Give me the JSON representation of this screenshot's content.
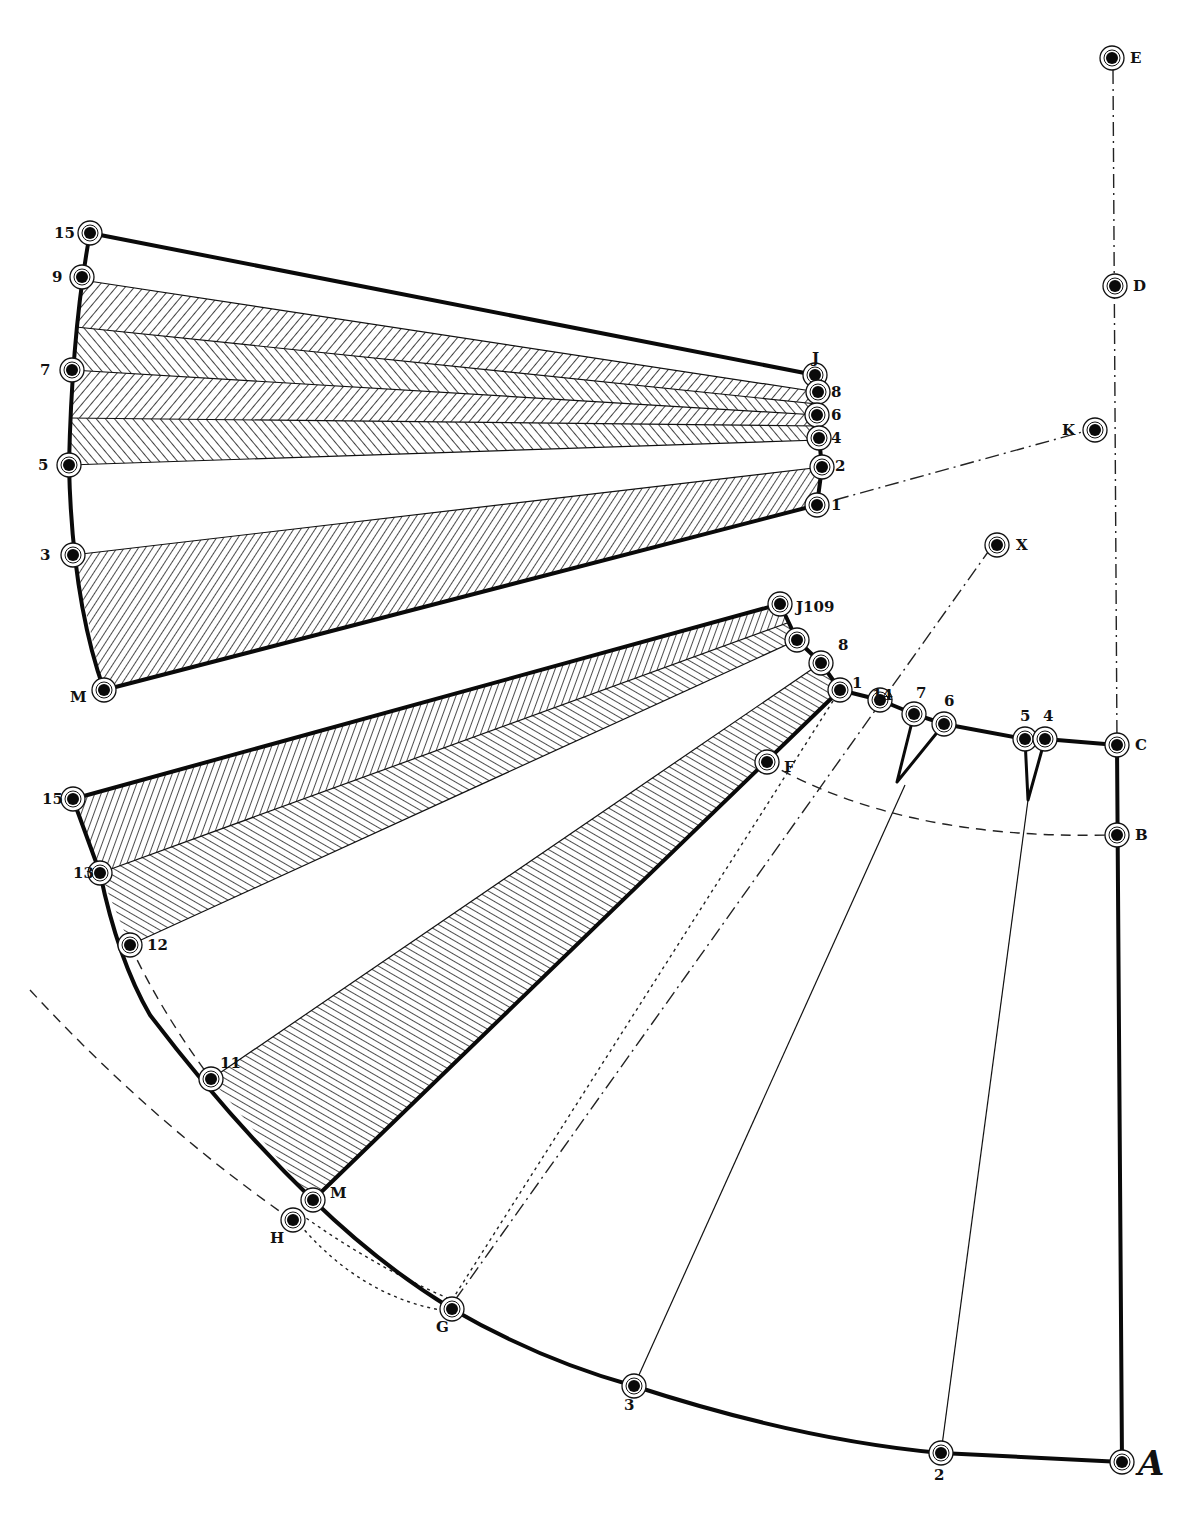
{
  "diagram": {
    "colors": {
      "ink": "#0a0a0a",
      "paper": "#ffffff"
    },
    "points": [
      {
        "id": "E",
        "label": "E",
        "x": 1112,
        "y": 58,
        "lx": 1130,
        "ly": 63
      },
      {
        "id": "D",
        "label": "D",
        "x": 1115,
        "y": 286,
        "lx": 1133,
        "ly": 291
      },
      {
        "id": "K",
        "label": "K",
        "x": 1095,
        "y": 430,
        "lx": 1062,
        "ly": 435
      },
      {
        "id": "X",
        "label": "X",
        "x": 997,
        "y": 545,
        "lx": 1016,
        "ly": 550
      },
      {
        "id": "C",
        "label": "C",
        "x": 1117,
        "y": 745,
        "lx": 1135,
        "ly": 750
      },
      {
        "id": "B",
        "label": "B",
        "x": 1117,
        "y": 835,
        "lx": 1135,
        "ly": 840
      },
      {
        "id": "A",
        "label": "A",
        "x": 1122,
        "y": 1462,
        "lx": 1138,
        "ly": 1475
      },
      {
        "id": "P2",
        "label": "2",
        "x": 941,
        "y": 1453,
        "lx": 934,
        "ly": 1480
      },
      {
        "id": "P3",
        "label": "3",
        "x": 634,
        "y": 1386,
        "lx": 624,
        "ly": 1410
      },
      {
        "id": "G",
        "label": "G",
        "x": 452,
        "y": 1309,
        "lx": 436,
        "ly": 1332
      },
      {
        "id": "H",
        "label": "H",
        "x": 293,
        "y": 1220,
        "lx": 270,
        "ly": 1243
      },
      {
        "id": "M2",
        "label": "M",
        "x": 313,
        "y": 1200,
        "lx": 330,
        "ly": 1198
      },
      {
        "id": "P11",
        "label": "11",
        "x": 211,
        "y": 1079,
        "lx": 220,
        "ly": 1068
      },
      {
        "id": "P12",
        "label": "12",
        "x": 130,
        "y": 945,
        "lx": 147,
        "ly": 950
      },
      {
        "id": "P13",
        "label": "13",
        "x": 100,
        "y": 873,
        "lx": 73,
        "ly": 878
      },
      {
        "id": "P15",
        "label": "15",
        "x": 73,
        "y": 799,
        "lx": 42,
        "ly": 804
      },
      {
        "id": "F",
        "label": "F",
        "x": 767,
        "y": 762,
        "lx": 784,
        "ly": 772
      },
      {
        "id": "P1b",
        "label": "1",
        "x": 840,
        "y": 690,
        "lx": 852,
        "ly": 688
      },
      {
        "id": "P8b",
        "label": "8",
        "x": 821,
        "y": 663,
        "lx": 838,
        "ly": 650
      },
      {
        "id": "P9b",
        "label": "9",
        "x": 797,
        "y": 640,
        "lx": 0,
        "ly": 0
      },
      {
        "id": "J2",
        "label": "J109",
        "x": 780,
        "y": 604,
        "lx": 796,
        "ly": 612
      },
      {
        "id": "P14",
        "label": "14",
        "x": 880,
        "y": 700,
        "lx": 872,
        "ly": 700
      },
      {
        "id": "P7b",
        "label": "7",
        "x": 914,
        "y": 714,
        "lx": 916,
        "ly": 698
      },
      {
        "id": "P6b",
        "label": "6",
        "x": 944,
        "y": 724,
        "lx": 944,
        "ly": 706
      },
      {
        "id": "P5b",
        "label": "5",
        "x": 1025,
        "y": 739,
        "lx": 1020,
        "ly": 721
      },
      {
        "id": "P4b",
        "label": "4",
        "x": 1045,
        "y": 739,
        "lx": 1043,
        "ly": 721
      },
      {
        "id": "M1",
        "label": "M",
        "x": 104,
        "y": 690,
        "lx": 70,
        "ly": 702
      },
      {
        "id": "P3a",
        "label": "3",
        "x": 73,
        "y": 555,
        "lx": 40,
        "ly": 560
      },
      {
        "id": "P5a",
        "label": "5",
        "x": 69,
        "y": 465,
        "lx": 38,
        "ly": 470
      },
      {
        "id": "P7a",
        "label": "7",
        "x": 72,
        "y": 370,
        "lx": 40,
        "ly": 375
      },
      {
        "id": "P9a",
        "label": "9",
        "x": 82,
        "y": 277,
        "lx": 52,
        "ly": 282
      },
      {
        "id": "P15a",
        "label": "15",
        "x": 90,
        "y": 233,
        "lx": 54,
        "ly": 238
      },
      {
        "id": "J1",
        "label": "J",
        "x": 815,
        "y": 375,
        "lx": 812,
        "ly": 363
      },
      {
        "id": "P8a",
        "label": "8",
        "x": 818,
        "y": 392,
        "lx": 831,
        "ly": 397
      },
      {
        "id": "P6a",
        "label": "6",
        "x": 817,
        "y": 415,
        "lx": 831,
        "ly": 420
      },
      {
        "id": "P4a",
        "label": "4",
        "x": 819,
        "y": 438,
        "lx": 831,
        "ly": 443
      },
      {
        "id": "P2a",
        "label": "2",
        "x": 822,
        "y": 467,
        "lx": 835,
        "ly": 471
      },
      {
        "id": "P1a",
        "label": "1",
        "x": 817,
        "y": 505,
        "lx": 831,
        "ly": 510
      }
    ],
    "panels": [
      {
        "name": "upper-fan-panel",
        "hatch": "chevron",
        "region": "J to 15 through M"
      },
      {
        "name": "lower-left-panel",
        "hatch": "chevron",
        "region": "J109 to 15 through 12"
      },
      {
        "name": "lower-right-panel",
        "hatch": "diagonal",
        "region": "1 to M through 11"
      }
    ],
    "guide_lines": [
      {
        "from": "E",
        "to": "C",
        "style": "dash-dot"
      },
      {
        "from": "1",
        "to": "K",
        "style": "dash-dot"
      },
      {
        "from": "G",
        "to": "X",
        "style": "dash-dot"
      },
      {
        "from": "F",
        "to": "B",
        "style": "dashed-arc"
      },
      {
        "from": "H",
        "to": "G",
        "style": "dashed-arc"
      }
    ]
  }
}
